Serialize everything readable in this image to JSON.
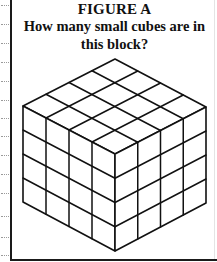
{
  "figure": {
    "label": "FIGURE A",
    "question": "How many small cubes are in this block?"
  },
  "cube": {
    "units_per_edge": 4,
    "line_color": "#111111",
    "face_color": "#ffffff",
    "projection": "isometric"
  },
  "frame": {
    "line_color": "#1a1a1a",
    "dotted_guide_color": "#9a9a9a"
  }
}
